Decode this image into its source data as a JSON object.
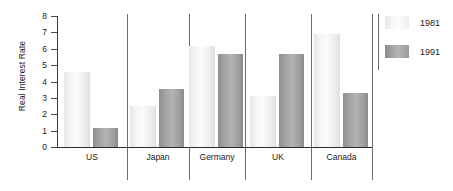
{
  "chart_data": {
    "type": "bar",
    "title": "",
    "xlabel": "",
    "ylabel": "Real Interest Rate",
    "ylim": [
      0,
      8
    ],
    "ytick_labels": [
      "8",
      "7",
      "6",
      "5",
      "4",
      "3",
      "2",
      "1",
      "0"
    ],
    "ytick_values": [
      8,
      7,
      6,
      5,
      4,
      3,
      2,
      1,
      0
    ],
    "grid": false,
    "legend_position": "right",
    "categories": [
      "US",
      "Japan",
      "Germany",
      "UK",
      "Canada"
    ],
    "series": [
      {
        "name": "1981",
        "color": "#f2f2f2",
        "values": [
          4.6,
          2.5,
          6.15,
          3.1,
          6.9
        ]
      },
      {
        "name": "1991",
        "color": "#a3a3a3",
        "values": [
          1.15,
          3.55,
          5.7,
          5.7,
          3.3
        ]
      }
    ]
  },
  "legend": {
    "entries": [
      {
        "label": "1981",
        "swatch": "light-gradient-swatch"
      },
      {
        "label": "1991",
        "swatch": "dark-gradient-swatch"
      }
    ]
  },
  "axes": {
    "y_title": "Real Interest Rate"
  }
}
